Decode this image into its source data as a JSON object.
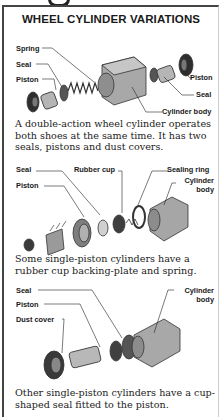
{
  "page": {
    "title": "WHEEL CYLINDER VARIATIONS"
  },
  "figures": [
    {
      "labels": {
        "spring": "Spring",
        "seal_left": "Seal",
        "piston_left": "Piston",
        "piston_right": "Piston",
        "seal_right": "Seal",
        "cylinder_body": "Cylinder body"
      },
      "caption": "A double-action wheel cylinder operates both shoes at the same time. It has two seals, pistons and dust covers."
    },
    {
      "labels": {
        "seal": "Seal",
        "piston": "Piston",
        "rubber_cup": "Rubber cup",
        "sealing_ring": "Sealing ring",
        "cylinder_body_line1": "Cylinder",
        "cylinder_body_line2": "body"
      },
      "caption": "Some single-piston cylinders have a rubber cup backing-plate and spring."
    },
    {
      "labels": {
        "seal": "Seal",
        "piston": "Piston",
        "dust_cover": "Dust cover",
        "cylinder_body_line1": "Cylinder",
        "cylinder_body_line2": "body"
      },
      "caption": "Other single-piston cylinders have a cup-shaped seal fitted to the piston."
    }
  ],
  "colors": {
    "ink": "#1a1a1a",
    "part_gray": "#9a9a9a",
    "part_dark": "#3a3a3a",
    "border": "#444444"
  }
}
